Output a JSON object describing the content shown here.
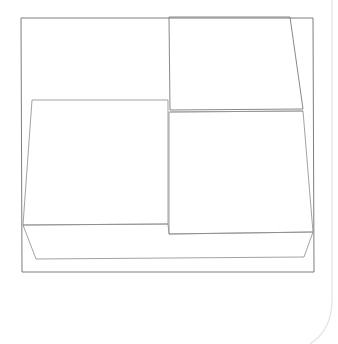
{
  "canvas": {
    "width": 338,
    "height": 344,
    "background": "#ffffff"
  },
  "colors": {
    "frame_stroke": "#6e6e6e",
    "shape_stroke": "#8a8a8a",
    "page_edge_stroke": "#e2e2e2"
  },
  "shapes": [
    {
      "name": "outer-frame",
      "points": "21,18 313,18 314,272 22,272",
      "stroke": "#6e6e6e",
      "width": 0.9
    },
    {
      "name": "top-right-box",
      "points": "169,17 290,17 303,109 170,110",
      "stroke": "#7a7a7a",
      "width": 0.9
    },
    {
      "name": "top-right-box-lower-edge",
      "points": "170,112 303,111",
      "stroke": "#a0a0a0",
      "width": 0.8,
      "open": true
    },
    {
      "name": "left-box",
      "points": "32,100 168,100 168,224 23,225",
      "stroke": "#8a8a8a",
      "width": 0.8
    },
    {
      "name": "lower-right-box",
      "points": "169,112 303,111 313,232 169,234",
      "stroke": "#8a8a8a",
      "width": 0.8
    },
    {
      "name": "base-platform",
      "points": "23,225 168,224 169,234 313,232 304,257 36,259",
      "stroke": "#8a8a8a",
      "width": 0.8
    },
    {
      "name": "page-edge",
      "path": "M332,0 L332,300 Q332,330 310,344",
      "stroke": "#e2e2e2",
      "width": 1.2
    }
  ]
}
